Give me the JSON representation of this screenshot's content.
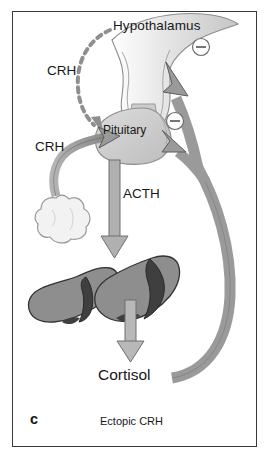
{
  "figure": {
    "panel_letter": "c",
    "caption": "Ectopic CRH",
    "background_color": "#ffffff",
    "border_color": "#3a3a3c"
  },
  "labels": {
    "hypothalamus": "Hypothalamus",
    "crh_hypothalamic": "CRH",
    "crh_ectopic": "CRH",
    "pituitary": "Pituitary",
    "acth": "ACTH",
    "cortisol": "Cortisol"
  },
  "feedback_signs": {
    "hypothalamus_inhibition": "−",
    "pituitary_inhibition": "−"
  },
  "colors": {
    "organ_gray": "#c9c9c9",
    "arrow_gray": "#9a9a9a",
    "arrow_outline": "#5d5d5d",
    "adrenal_cortex": "#8e8e8e",
    "adrenal_medulla": "#3f3f3f",
    "tumor_fill": "#f2f2f2",
    "text": "#17171a"
  },
  "structures": [
    {
      "name": "hypothalamus",
      "kind": "organ"
    },
    {
      "name": "pituitary",
      "kind": "organ"
    },
    {
      "name": "ectopic-tumor",
      "kind": "lesion"
    },
    {
      "name": "adrenal-gland-left",
      "kind": "organ"
    },
    {
      "name": "adrenal-gland-right",
      "kind": "organ"
    }
  ],
  "arrows": [
    {
      "name": "crh-dashed-arrow",
      "style": "dashed",
      "from": "hypothalamus",
      "to": "pituitary"
    },
    {
      "name": "crh-ectopic-arrow",
      "style": "solid",
      "from": "ectopic-tumor",
      "to": "pituitary"
    },
    {
      "name": "acth-arrow",
      "style": "solid",
      "from": "pituitary",
      "to": "adrenal-glands"
    },
    {
      "name": "cortisol-arrow",
      "style": "solid",
      "from": "adrenal-glands",
      "to": "cortisol"
    },
    {
      "name": "cortisol-feedback-hypothalamus",
      "style": "solid",
      "from": "cortisol",
      "to": "hypothalamus"
    },
    {
      "name": "cortisol-feedback-pituitary",
      "style": "solid",
      "from": "cortisol",
      "to": "pituitary"
    }
  ]
}
